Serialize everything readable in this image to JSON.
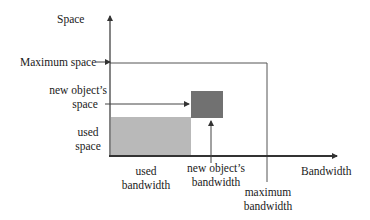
{
  "diagram": {
    "axes": {
      "y_label": "Space",
      "x_label": "Bandwidth"
    },
    "labels": {
      "maximum_space": "Maximum space",
      "new_object_space_line1": "new object’s",
      "new_object_space_line2": "space",
      "used_space_line1": "used",
      "used_space_line2": "space",
      "used_bandwidth_line1": "used",
      "used_bandwidth_line2": "bandwidth",
      "new_object_bandwidth_line1": "new object’s",
      "new_object_bandwidth_line2": "bandwidth",
      "maximum_bandwidth_line1": "maximum",
      "maximum_bandwidth_line2": "bandwidth"
    },
    "colors": {
      "used_region": "#b9b9b9",
      "new_object_region": "#717171",
      "lines": "#333333"
    }
  }
}
